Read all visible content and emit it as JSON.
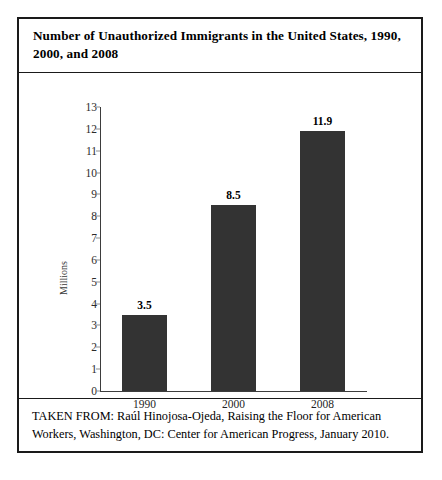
{
  "figure": {
    "title": "Number of Unauthorized Immigrants in the United States, 1990, 2000, and 2008",
    "caption": "TAKEN FROM: Raúl Hinojosa-Ojeda, Raising the Floor for American Workers, Washington, DC: Center for American Progress, January 2010.",
    "bar_color": "#333333",
    "frame_color": "#1a1a1a"
  },
  "chart_data": {
    "type": "bar",
    "title": "Number of Unauthorized Immigrants in the United States, 1990, 2000, and 2008",
    "categories": [
      "1990",
      "2000",
      "2008"
    ],
    "values": [
      3.5,
      8.5,
      11.9
    ],
    "value_labels": [
      "3.5",
      "8.5",
      "11.9"
    ],
    "xlabel": "",
    "ylabel": "Millions",
    "ylim": [
      0,
      13
    ],
    "ytick_step": 1,
    "yticks": [
      0,
      1,
      2,
      3,
      4,
      5,
      6,
      7,
      8,
      9,
      10,
      11,
      12,
      13
    ],
    "ytick_labels": [
      "0",
      "1",
      "2",
      "3",
      "4",
      "5",
      "6",
      "7",
      "8",
      "9",
      "10",
      "11",
      "12",
      "13"
    ],
    "grid": false,
    "legend": false,
    "legend_position": "none",
    "series": [
      {
        "name": "Unauthorized immigrants (millions)",
        "values": [
          3.5,
          8.5,
          11.9
        ]
      }
    ]
  }
}
